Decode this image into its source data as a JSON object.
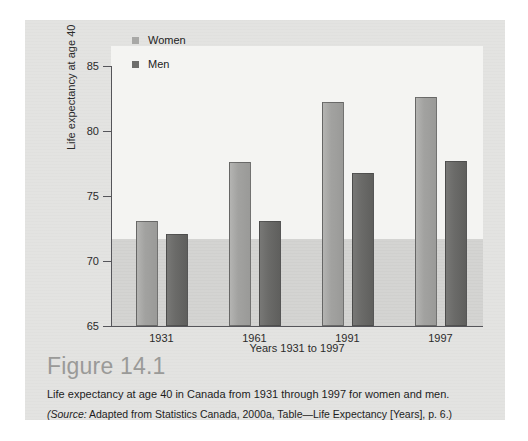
{
  "figure": {
    "number_label": "Figure 14.1",
    "caption": "Life expectancy at age 40 in Canada from 1931 through 1997 for women and men.",
    "source_prefix": "(Source:",
    "source_text": " Adapted from Statistics Canada, 2000a, Table—Life Expectancy [Years], p. 6.)"
  },
  "colors": {
    "women_bar": "#a2a2a0",
    "men_bar": "#6b6b69",
    "plot_upper_band": "#f4f4f2",
    "plot_lower_band": "#d3d3d1",
    "card_background": "#e3e3e1",
    "axis_line": "#55555a"
  },
  "chart_data": {
    "type": "bar",
    "title": "",
    "xlabel": "Years 1931 to 1997",
    "ylabel": "Life expectancy at age 40",
    "categories": [
      "1931",
      "1961",
      "1991",
      "1997"
    ],
    "series": [
      {
        "name": "Women",
        "values": [
          73.1,
          77.6,
          82.2,
          82.6
        ]
      },
      {
        "name": "Men",
        "values": [
          72.1,
          73.1,
          76.8,
          77.7
        ]
      }
    ],
    "ylim": [
      65,
      85
    ],
    "yticks": [
      65,
      70,
      75,
      80,
      85
    ],
    "ytick_labels": [
      "65",
      "70",
      "75",
      "80",
      "85"
    ],
    "grid": false,
    "legend": [
      "Women",
      "Men"
    ],
    "legend_position": "top-left-inside"
  }
}
